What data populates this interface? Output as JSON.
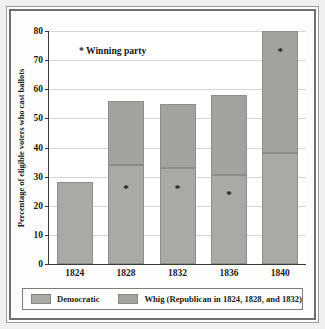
{
  "chart_data": {
    "type": "bar",
    "stacked": true,
    "title": "",
    "xlabel": "",
    "ylabel": "Percentage of eligible voters who cast ballots",
    "ylim": [
      0,
      80
    ],
    "yticks": [
      0,
      10,
      20,
      30,
      40,
      50,
      60,
      70,
      80
    ],
    "grid": true,
    "legend_position": "bottom",
    "categories": [
      "1824",
      "1828",
      "1832",
      "1836",
      "1840"
    ],
    "series": [
      {
        "name": "Democratic",
        "color": "#a9a9a6",
        "values": [
          28,
          34,
          33,
          30.5,
          38
        ]
      },
      {
        "name": "Whig (Republican in 1824, 1828, and 1832)",
        "color": "#a2a29f",
        "values": [
          0,
          22,
          22,
          27.5,
          42
        ]
      }
    ],
    "totals": [
      28,
      56,
      55,
      58,
      80
    ],
    "annotations": [
      {
        "label": "* Winning party"
      }
    ],
    "winner_markers": [
      {
        "category": "1828",
        "segment": "Democratic",
        "value": 27
      },
      {
        "category": "1832",
        "segment": "Democratic",
        "value": 27
      },
      {
        "category": "1836",
        "segment": "Democratic",
        "value": 25
      },
      {
        "category": "1840",
        "segment": "Whig",
        "value": 74
      }
    ]
  },
  "annotation": {
    "winning_party_note": "* Winning party"
  },
  "axis": {
    "y_title": "Percentage of eligible voters who cast ballots",
    "y_tick_0": "0",
    "y_tick_10": "10",
    "y_tick_20": "20",
    "y_tick_30": "30",
    "y_tick_40": "40",
    "y_tick_50": "50",
    "y_tick_60": "60",
    "y_tick_70": "70",
    "y_tick_80": "80",
    "x_tick_0": "1824",
    "x_tick_1": "1828",
    "x_tick_2": "1832",
    "x_tick_3": "1836",
    "x_tick_4": "1840"
  },
  "legend": {
    "democratic_label": "Democratic",
    "whig_label": "Whig (Republican in 1824, 1828, and 1832)"
  },
  "colors": {
    "democratic": "#a9a9a6",
    "whig": "#a2a29f",
    "axis": "#3a3a38",
    "grid": "#d8d6d2",
    "text": "#1c1c1a"
  }
}
